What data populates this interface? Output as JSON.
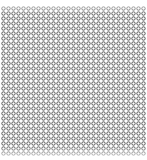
{
  "pattern": {
    "type": "ring-grid",
    "columns": 29,
    "rows": 30,
    "pitch_px": 5,
    "ring_radius_px": 1.7,
    "ring_stroke_px": 1,
    "ring_color": "#555555",
    "background_color": "#ffffff"
  }
}
